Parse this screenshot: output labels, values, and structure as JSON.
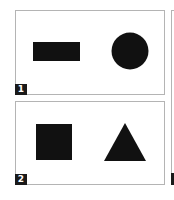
{
  "panels": [
    {
      "id": 1,
      "badge_label": "1",
      "shapes": [
        {
          "type": "rectangle",
          "fill": "#111111",
          "label": "black-rectangle"
        },
        {
          "type": "circle",
          "fill": "#111111",
          "label": "black-circle"
        }
      ]
    },
    {
      "id": 2,
      "badge_label": "2",
      "shapes": [
        {
          "type": "square",
          "fill": "#111111",
          "label": "black-square"
        },
        {
          "type": "triangle",
          "fill": "#111111",
          "label": "black-triangle"
        }
      ]
    },
    {
      "id": 3,
      "badge_label": "",
      "partial": true
    }
  ],
  "colors": {
    "shape_fill": "#111111",
    "panel_border": "#b4b4b4",
    "badge_bg": "#1a1a1a",
    "badge_text": "#ffffff"
  }
}
